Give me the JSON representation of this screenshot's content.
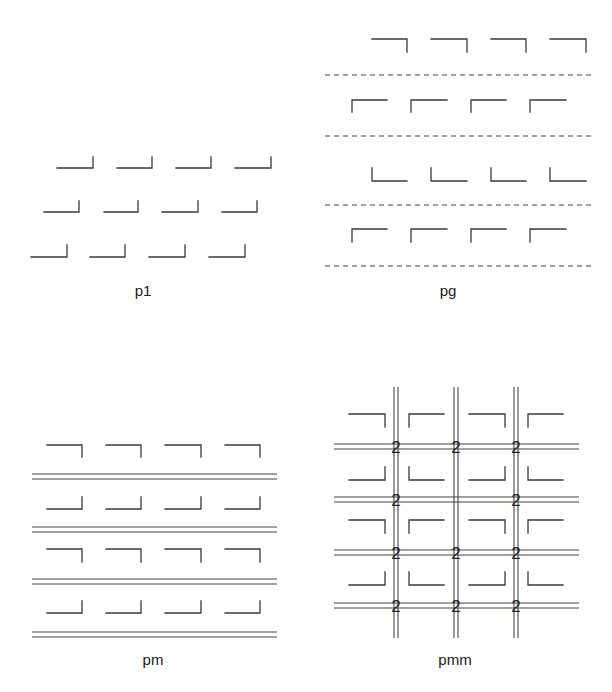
{
  "figure": {
    "panels": [
      {
        "id": "p1",
        "caption": "p1",
        "motif_rows": [
          {
            "shape": "corner-bottom-right",
            "y_base": 168,
            "y_top": 157,
            "xs": [
              [
                57,
                93
              ],
              [
                117,
                152
              ],
              [
                176,
                211
              ],
              [
                235,
                271
              ]
            ]
          },
          {
            "shape": "corner-bottom-right",
            "y_base": 212,
            "y_top": 201,
            "xs": [
              [
                44,
                79
              ],
              [
                104,
                138
              ],
              [
                162,
                198
              ],
              [
                222,
                257
              ]
            ]
          },
          {
            "shape": "corner-bottom-right",
            "y_base": 257,
            "y_top": 245,
            "xs": [
              [
                31,
                67
              ],
              [
                90,
                125
              ],
              [
                149,
                185
              ],
              [
                209,
                245
              ]
            ]
          }
        ],
        "caption_pos": [
          143,
          296
        ]
      },
      {
        "id": "pg",
        "caption": "pg",
        "motif_rows": [
          {
            "shape": "corner-top-right",
            "y_h": 39,
            "y_v": 52,
            "xs": [
              [
                372,
                407
              ],
              [
                431,
                467
              ],
              [
                491,
                526
              ],
              [
                550,
                586
              ]
            ]
          },
          {
            "shape": "corner-top-left",
            "y_h": 100,
            "y_v": 112,
            "xs": [
              [
                352,
                387
              ],
              [
                411,
                447
              ],
              [
                471,
                506
              ],
              [
                530,
                566
              ]
            ]
          },
          {
            "shape": "corner-bottom-left",
            "y_h": 181,
            "y_v": 168,
            "xs": [
              [
                372,
                407
              ],
              [
                431,
                467
              ],
              [
                491,
                526
              ],
              [
                550,
                586
              ]
            ]
          },
          {
            "shape": "corner-top-left",
            "y_h": 229,
            "y_v": 242,
            "xs": [
              [
                352,
                387
              ],
              [
                411,
                447
              ],
              [
                471,
                506
              ],
              [
                530,
                566
              ]
            ]
          }
        ],
        "glide_lines": {
          "style": "dashed",
          "ys": [
            75,
            136,
            205,
            266
          ],
          "x1": 325,
          "x2": 595
        },
        "caption_pos": [
          448,
          296
        ]
      },
      {
        "id": "pm",
        "caption": "pm",
        "motif_rows": [
          {
            "shape": "corner-top-right",
            "y_h": 445,
            "y_v": 457,
            "xs": [
              [
                47,
                82
              ],
              [
                106,
                141
              ],
              [
                165,
                201
              ],
              [
                225,
                260
              ]
            ]
          },
          {
            "shape": "corner-bottom-right",
            "y_h": 509,
            "y_v": 497,
            "xs": [
              [
                47,
                82
              ],
              [
                106,
                141
              ],
              [
                165,
                201
              ],
              [
                225,
                260
              ]
            ]
          },
          {
            "shape": "corner-top-right",
            "y_h": 549,
            "y_v": 562,
            "xs": [
              [
                47,
                82
              ],
              [
                106,
                141
              ],
              [
                165,
                201
              ],
              [
                225,
                260
              ]
            ]
          },
          {
            "shape": "corner-bottom-right",
            "y_h": 613,
            "y_v": 601,
            "xs": [
              [
                47,
                82
              ],
              [
                106,
                141
              ],
              [
                165,
                201
              ],
              [
                225,
                260
              ]
            ]
          }
        ],
        "mirror_lines": {
          "style": "double",
          "pairs": [
            [
              474,
              479
            ],
            [
              527,
              532
            ],
            [
              579,
              584
            ],
            [
              632,
              637
            ]
          ],
          "x1": 32,
          "x2": 277
        },
        "caption_pos": [
          153,
          665
        ]
      },
      {
        "id": "pmm",
        "caption": "pmm",
        "motif_rows": [
          {
            "y_h": 414,
            "y_v": 427,
            "cells": [
              {
                "shape": "corner-top-right",
                "x": [
                  349,
                  385
                ]
              },
              {
                "shape": "corner-top-left",
                "x": [
                  409,
                  444
                ]
              },
              {
                "shape": "corner-top-right",
                "x": [
                  469,
                  505
                ]
              },
              {
                "shape": "corner-top-left",
                "x": [
                  528,
                  563
                ]
              }
            ]
          },
          {
            "y_h": 480,
            "y_v": 467,
            "cells": [
              {
                "shape": "corner-bottom-right",
                "x": [
                  349,
                  385
                ]
              },
              {
                "shape": "corner-bottom-left",
                "x": [
                  409,
                  444
                ]
              },
              {
                "shape": "corner-bottom-right",
                "x": [
                  469,
                  505
                ]
              },
              {
                "shape": "corner-bottom-left",
                "x": [
                  528,
                  563
                ]
              }
            ]
          },
          {
            "y_h": 520,
            "y_v": 533,
            "cells": [
              {
                "shape": "corner-top-right",
                "x": [
                  349,
                  385
                ]
              },
              {
                "shape": "corner-top-left",
                "x": [
                  409,
                  444
                ]
              },
              {
                "shape": "corner-top-right",
                "x": [
                  469,
                  505
                ]
              },
              {
                "shape": "corner-top-left",
                "x": [
                  528,
                  563
                ]
              }
            ]
          },
          {
            "y_h": 585,
            "y_v": 572,
            "cells": [
              {
                "shape": "corner-bottom-right",
                "x": [
                  349,
                  385
                ]
              },
              {
                "shape": "corner-bottom-left",
                "x": [
                  409,
                  444
                ]
              },
              {
                "shape": "corner-bottom-right",
                "x": [
                  469,
                  505
                ]
              },
              {
                "shape": "corner-bottom-left",
                "x": [
                  528,
                  563
                ]
              }
            ]
          }
        ],
        "mirror_lines_h": {
          "pairs": [
            [
              444,
              449
            ],
            [
              497,
              502
            ],
            [
              550,
              555
            ],
            [
              603,
              608
            ]
          ],
          "x1": 334,
          "x2": 579
        },
        "mirror_lines_v": {
          "pairs": [
            [
              394,
              398
            ],
            [
              454,
              458
            ],
            [
              514,
              518
            ]
          ],
          "y1": 387,
          "y2": 638
        },
        "rotation_label": "2",
        "rotation_centers": [
          [
            396,
            447
          ],
          [
            456,
            447
          ],
          [
            516,
            447
          ],
          [
            396,
            500
          ],
          [
            516,
            500
          ],
          [
            396,
            553
          ],
          [
            456,
            553
          ],
          [
            516,
            553
          ],
          [
            396,
            606
          ],
          [
            456,
            606
          ],
          [
            516,
            606
          ]
        ],
        "caption_pos": [
          455,
          665
        ]
      }
    ]
  }
}
